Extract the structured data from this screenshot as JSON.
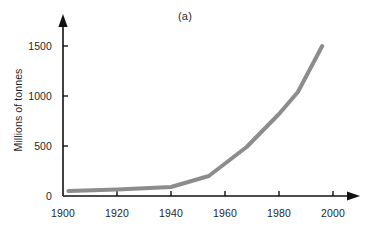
{
  "figure": {
    "panel_label": "(a)",
    "background_color": "#ffffff"
  },
  "chart_data": {
    "type": "line",
    "title": "(a)",
    "xlabel": "",
    "ylabel": "Millions of tonnes",
    "xlim": [
      1900,
      2008
    ],
    "ylim": [
      0,
      1560
    ],
    "grid": false,
    "legend": null,
    "line_color": "#8c8c8c",
    "line_width": 4,
    "axis_color": "#111111",
    "xticks": [
      1900,
      1920,
      1940,
      1960,
      1980,
      2000
    ],
    "xtick_labels": [
      "1900",
      "1920",
      "1940",
      "1960",
      "1980",
      "2000"
    ],
    "yticks": [
      0,
      500,
      1000,
      1500
    ],
    "ytick_labels": [
      "0",
      "500",
      "1000",
      "1500"
    ],
    "x": [
      1902,
      1920,
      1940,
      1954,
      1968,
      1980,
      1987,
      1996
    ],
    "values": [
      50,
      65,
      90,
      200,
      490,
      820,
      1040,
      1500
    ],
    "series": [
      {
        "name": "Production",
        "x": [
          1902,
          1920,
          1940,
          1954,
          1968,
          1980,
          1987,
          1996
        ],
        "values": [
          50,
          65,
          90,
          200,
          490,
          820,
          1040,
          1500
        ]
      }
    ]
  },
  "axes_geometry": {
    "x_origin_px": 63,
    "y_origin_px": 196,
    "px_per_20_years": 54,
    "px_per_500_units": 50
  }
}
